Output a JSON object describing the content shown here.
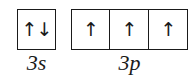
{
  "diagram": {
    "type": "orbital-box-diagram",
    "subshells": [
      {
        "label": "3s",
        "orbitals": [
          {
            "electrons": "↑↓",
            "spins": [
              "up",
              "down"
            ]
          }
        ]
      },
      {
        "label": "3p",
        "orbitals": [
          {
            "electrons": "↑",
            "spins": [
              "up"
            ]
          },
          {
            "electrons": "↑",
            "spins": [
              "up"
            ]
          },
          {
            "electrons": "↑",
            "spins": [
              "up"
            ]
          }
        ]
      }
    ],
    "colors": {
      "line": "#1a1a1a",
      "background": "#ffffff"
    }
  }
}
